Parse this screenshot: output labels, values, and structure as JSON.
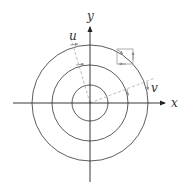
{
  "diagram": {
    "center": {
      "x": 90,
      "y": 103
    },
    "axes": {
      "x_label": "x",
      "y_label": "y"
    },
    "circles": [
      {
        "name": "inner",
        "radius": 18
      },
      {
        "name": "middle",
        "radius": 38
      },
      {
        "name": "outer",
        "radius": 58
      }
    ],
    "rotated_axes": {
      "u_label": "u",
      "v_label": "v"
    },
    "colors": {
      "line": "#333333",
      "dashed": "#aaaaaa"
    }
  }
}
